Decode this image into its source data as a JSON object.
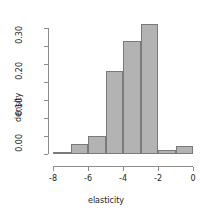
{
  "chart_data": {
    "type": "bar",
    "title": "",
    "subtitle": "",
    "xlabel": "elasticity",
    "ylabel": "density",
    "grid": false,
    "legend": "none",
    "bin_width": 1,
    "bin_edges": [
      -8,
      -7,
      -6,
      -5,
      -4,
      -3,
      -2,
      -1,
      0
    ],
    "categories": [
      "-8 to -7",
      "-7 to -6",
      "-6 to -5",
      "-5 to -4",
      "-4 to -3",
      "-3 to -2",
      "-2 to -1",
      "-1 to 0"
    ],
    "values": [
      0.005,
      0.027,
      0.05,
      0.231,
      0.314,
      0.361,
      0.012,
      0.022
    ],
    "xlim": [
      -8,
      0
    ],
    "ylim": [
      0,
      0.37
    ],
    "x_ticks": [
      -8,
      -6,
      -4,
      -2,
      0
    ],
    "x_tick_labels": [
      "-8",
      "-6",
      "-4",
      "-2",
      "0"
    ],
    "y_ticks": [
      0.0,
      0.05,
      0.1,
      0.15,
      0.2,
      0.25,
      0.3,
      0.35
    ],
    "y_tick_labels": [
      "0.00",
      "",
      "0.10",
      "",
      "0.20",
      "",
      "0.30",
      ""
    ],
    "bar_fill": "#b3b3b3",
    "bar_border": "#7a7a7a",
    "axis_color": "#8c8c8c"
  }
}
